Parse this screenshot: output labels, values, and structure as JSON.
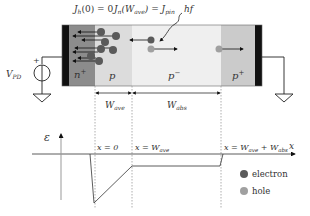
{
  "header_labels": {
    "jh0": "J",
    "jh0_sub": "h",
    "jh0_rest": "(0) = 0",
    "jn": "J",
    "jn_sub": "n",
    "jn_arg": "(W",
    "jn_arg_sub": "ave",
    "jn_eq": ") = J",
    "jn_eq_sub": "pin",
    "photon": "hf"
  },
  "regions": [
    {
      "name": "n+",
      "label": "n",
      "sup": "+",
      "color": "#8c8c8c"
    },
    {
      "name": "p",
      "label": "p",
      "sup": "",
      "color": "#dcdcdc"
    },
    {
      "name": "p-",
      "label": "p",
      "sup": "−",
      "color": "#efefef"
    },
    {
      "name": "p+",
      "label": "p",
      "sup": "+",
      "color": "#cbcbcb"
    }
  ],
  "source": {
    "label": "V",
    "sub": "PD",
    "plus": "+"
  },
  "widths": {
    "w_ave": "W",
    "w_ave_sub": "ave",
    "w_abs": "W",
    "w_abs_sub": "abs"
  },
  "field_plot": {
    "y_axis_label": "ε",
    "x_axis_label": "x",
    "marker_1": "x = 0",
    "marker_2": "x = W",
    "marker_2_sub": "ave",
    "marker_3": "x = W",
    "marker_3_sub": "ave",
    "marker_3_plus": " + W",
    "marker_3_sub2": "abs"
  },
  "legend": {
    "electron": {
      "label": "electron",
      "color": "#5a5a5a"
    },
    "hole": {
      "label": "hole",
      "color": "#a0a0a0"
    }
  }
}
